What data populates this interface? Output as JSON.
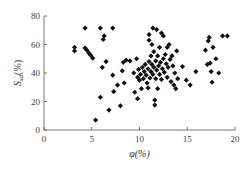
{
  "chart_data": {
    "type": "scatter",
    "title": "",
    "xlabel": "φ(%)",
    "ylabel": "S_sd(%)",
    "ylabel_main": "S",
    "ylabel_sub": "sd",
    "ylabel_unit": "(%)",
    "xlim": [
      0,
      20
    ],
    "ylim": [
      0,
      80
    ],
    "xticks": [
      0,
      5,
      10,
      15,
      20
    ],
    "yticks": [
      0,
      20,
      40,
      60,
      80
    ],
    "grid": false,
    "legend": null,
    "marker": "diamond",
    "marker_color": "#111111",
    "series": [
      {
        "name": "samples",
        "points": [
          [
            3.2,
            58
          ],
          [
            3.2,
            55.5
          ],
          [
            4.3,
            71.5
          ],
          [
            4.3,
            57.5
          ],
          [
            4.5,
            56
          ],
          [
            4.7,
            54
          ],
          [
            4.9,
            52.5
          ],
          [
            5.1,
            50.5
          ],
          [
            5.4,
            7
          ],
          [
            5.9,
            71.5
          ],
          [
            5.9,
            23
          ],
          [
            6.1,
            44
          ],
          [
            6.2,
            63.5
          ],
          [
            6.3,
            66
          ],
          [
            6.5,
            48
          ],
          [
            6.8,
            14
          ],
          [
            7.2,
            71.5
          ],
          [
            7.2,
            38.5
          ],
          [
            7.3,
            27
          ],
          [
            7.7,
            31.5
          ],
          [
            8.0,
            17
          ],
          [
            8.2,
            41.5
          ],
          [
            8.3,
            47.5
          ],
          [
            8.4,
            33
          ],
          [
            8.6,
            49
          ],
          [
            9.0,
            48.5
          ],
          [
            9.4,
            40
          ],
          [
            9.5,
            26.5
          ],
          [
            9.7,
            50
          ],
          [
            9.8,
            22
          ],
          [
            9.8,
            37
          ],
          [
            9.9,
            42.5
          ],
          [
            10.0,
            35
          ],
          [
            10.1,
            39
          ],
          [
            10.2,
            29
          ],
          [
            10.3,
            44
          ],
          [
            10.4,
            36
          ],
          [
            10.5,
            41
          ],
          [
            10.6,
            46
          ],
          [
            10.7,
            38.5
          ],
          [
            10.8,
            33
          ],
          [
            10.9,
            29.5
          ],
          [
            10.9,
            43
          ],
          [
            11.0,
            48
          ],
          [
            11.0,
            63
          ],
          [
            11.0,
            67
          ],
          [
            11.1,
            36.5
          ],
          [
            11.2,
            41
          ],
          [
            11.2,
            52
          ],
          [
            11.3,
            46
          ],
          [
            11.3,
            60
          ],
          [
            11.4,
            71.5
          ],
          [
            11.4,
            39
          ],
          [
            11.5,
            44
          ],
          [
            11.5,
            55
          ],
          [
            11.6,
            21
          ],
          [
            11.6,
            17.5
          ],
          [
            11.7,
            48.5
          ],
          [
            11.7,
            36
          ],
          [
            11.8,
            70.5
          ],
          [
            11.8,
            42
          ],
          [
            11.9,
            52
          ],
          [
            11.9,
            29
          ],
          [
            12.0,
            45
          ],
          [
            12.1,
            39
          ],
          [
            12.1,
            58
          ],
          [
            12.2,
            47.5
          ],
          [
            12.3,
            68
          ],
          [
            12.3,
            35.5
          ],
          [
            12.4,
            43
          ],
          [
            12.5,
            66
          ],
          [
            12.5,
            50
          ],
          [
            12.6,
            40.5
          ],
          [
            12.7,
            53
          ],
          [
            12.8,
            46.5
          ],
          [
            12.9,
            37
          ],
          [
            12.9,
            58
          ],
          [
            13.0,
            44
          ],
          [
            13.1,
            60
          ],
          [
            13.2,
            49.5
          ],
          [
            13.3,
            34
          ],
          [
            13.4,
            52
          ],
          [
            13.5,
            45
          ],
          [
            13.6,
            31.5
          ],
          [
            13.7,
            40
          ],
          [
            13.8,
            29
          ],
          [
            13.9,
            55.5
          ],
          [
            14.0,
            36
          ],
          [
            14.5,
            44.5
          ],
          [
            14.9,
            35
          ],
          [
            15.3,
            31.5
          ],
          [
            15.9,
            41
          ],
          [
            16.9,
            56
          ],
          [
            17.1,
            46
          ],
          [
            17.2,
            62.5
          ],
          [
            17.3,
            65
          ],
          [
            17.4,
            47
          ],
          [
            17.5,
            41
          ],
          [
            17.6,
            33.5
          ],
          [
            17.7,
            58
          ],
          [
            18.0,
            50
          ],
          [
            18.3,
            40
          ],
          [
            18.7,
            66
          ],
          [
            19.2,
            66
          ]
        ]
      }
    ]
  }
}
